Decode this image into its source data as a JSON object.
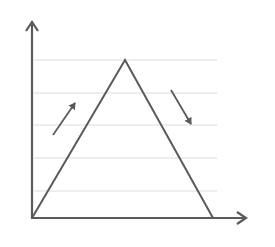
{
  "diagram": {
    "type": "triangle-peak-graph",
    "colors": {
      "background": "#ffffff",
      "line": "#5a5a5a",
      "grid": "#dcdcdc"
    },
    "gridlines_y": [
      60,
      93,
      125,
      158,
      191
    ],
    "triangle": {
      "start": [
        32,
        218
      ],
      "peak": [
        125,
        60
      ],
      "end": [
        213,
        218
      ]
    },
    "arrows": [
      {
        "label": "rising",
        "from": [
          53,
          135
        ],
        "to": [
          77,
          100
        ]
      },
      {
        "label": "falling",
        "from": [
          171,
          90
        ],
        "to": [
          193,
          127
        ]
      }
    ]
  }
}
